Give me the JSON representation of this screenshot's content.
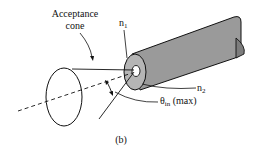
{
  "diagram": {
    "labels": {
      "acceptance_line1": "Acceptance",
      "acceptance_line2": "cone",
      "n1_base": "n",
      "n1_sub": "1",
      "n2_base": "n",
      "n2_sub": "2",
      "theta_base": "θ",
      "theta_sub": "in",
      "theta_suffix": " (max)",
      "caption": "(b)"
    },
    "colors": {
      "stroke": "#111111",
      "fiber_fill": "#9a9a9a",
      "cladding_face": "#b5b5b5",
      "core_fill": "#ffffff",
      "background": "#ffffff"
    }
  }
}
